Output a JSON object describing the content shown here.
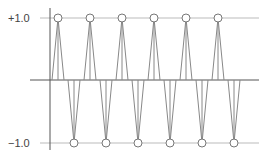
{
  "diagram": {
    "labels": {
      "top": "+1.0",
      "bottom": "−1.0"
    },
    "colors": {
      "line": "#888888",
      "axis": "#555555",
      "grid": "#bbbbbb",
      "marker_fill": "#ffffff",
      "marker_stroke": "#777777"
    },
    "geometry": {
      "axis_x": 50,
      "y_top": 18,
      "y_zero": 80,
      "y_bottom": 143,
      "x_end": 259,
      "half_width": 6,
      "marker_r": 4
    },
    "peaks_top_x": [
      58,
      90,
      122,
      154,
      186,
      218
    ],
    "peaks_bottom_x": [
      74,
      106,
      138,
      170,
      202,
      234
    ]
  }
}
